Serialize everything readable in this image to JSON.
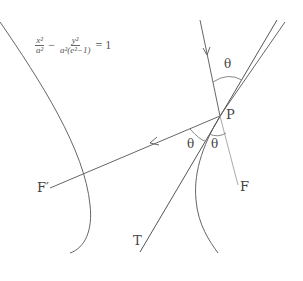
{
  "diagram": {
    "equation": {
      "term1_num": "x²",
      "term1_den": "a²",
      "minus": "−",
      "term2_num": "y²",
      "term2_den": "a²(e²−1)",
      "rhs": "= 1"
    },
    "labels": {
      "point": "P",
      "focus_right": "F",
      "focus_left": "F′",
      "tangent": "T",
      "angle_top": "θ",
      "angle_left": "θ",
      "angle_right": "θ"
    },
    "colors": {
      "line": "#555555",
      "light_line": "#999999",
      "text": "#444444"
    }
  }
}
